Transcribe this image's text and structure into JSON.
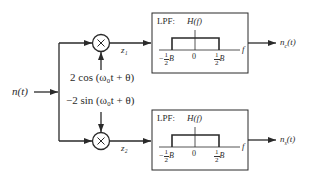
{
  "input": {
    "label": "n(t)"
  },
  "oscillators": {
    "top": {
      "label": "2 cos (ω₀t + θ)"
    },
    "bottom": {
      "label": "−2 sin (ω₀t + θ)"
    }
  },
  "multipliers": {
    "top": {
      "symbol": "×",
      "output_label": "z₁"
    },
    "bottom": {
      "symbol": "×",
      "output_label": "z₂"
    }
  },
  "filters": [
    {
      "title": "LPF:",
      "response_label": "H(f)",
      "axis_label": "f",
      "tick_left_coef": "1",
      "tick_left_den": "2",
      "tick_left_sign": "−",
      "tick_left_var": "B",
      "tick_center": "0",
      "tick_right_num": "1",
      "tick_right_den": "2",
      "tick_right_var": "B",
      "output_label": "n_c(t)",
      "output_base": "n",
      "output_sub": "c",
      "output_arg": "(t)"
    },
    {
      "title": "LPF:",
      "response_label": "H(f)",
      "axis_label": "f",
      "tick_left_coef": "1",
      "tick_left_den": "2",
      "tick_left_sign": "−",
      "tick_left_var": "B",
      "tick_center": "0",
      "tick_right_num": "1",
      "tick_right_den": "2",
      "tick_right_var": "B",
      "output_label": "n_s(t)",
      "output_base": "n",
      "output_sub": "s",
      "output_arg": "(t)"
    }
  ],
  "colors": {
    "line": "#2a2a2a",
    "background": "#ffffff"
  }
}
